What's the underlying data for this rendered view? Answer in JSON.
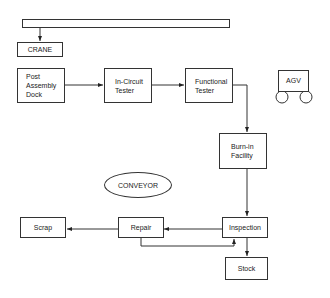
{
  "diagram": {
    "nodes": {
      "crane": {
        "label": "CRANE"
      },
      "post_assembly_dock": {
        "lines": [
          "Post",
          "Assembly",
          "Dock"
        ]
      },
      "in_circuit_tester": {
        "lines": [
          "In-Circuit",
          "Tester"
        ]
      },
      "functional_tester": {
        "lines": [
          "Functional",
          "Tester"
        ]
      },
      "agv": {
        "label": "AGV"
      },
      "burn_in_facility": {
        "lines": [
          "Burn-in",
          "Facility"
        ]
      },
      "conveyor": {
        "label": "CONVEYOR"
      },
      "scrap": {
        "label": "Scrap"
      },
      "repair": {
        "label": "Repair"
      },
      "inspection": {
        "label": "Inspection"
      },
      "stock": {
        "label": "Stock"
      }
    },
    "edges": [
      {
        "from": "crane_rail",
        "to": "crane"
      },
      {
        "from": "post_assembly_dock",
        "to": "in_circuit_tester"
      },
      {
        "from": "in_circuit_tester",
        "to": "functional_tester"
      },
      {
        "from": "functional_tester",
        "to": "burn_in_facility"
      },
      {
        "from": "burn_in_facility",
        "to": "inspection"
      },
      {
        "from": "inspection",
        "to": "repair"
      },
      {
        "from": "repair",
        "to": "scrap"
      },
      {
        "from": "repair",
        "to": "inspection"
      },
      {
        "from": "inspection",
        "to": "stock"
      }
    ],
    "colors": {
      "line": "#333333",
      "background": "#ffffff"
    }
  }
}
